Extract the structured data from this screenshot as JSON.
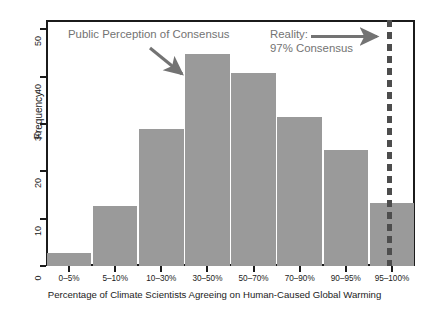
{
  "chart_data": {
    "type": "bar",
    "title": "",
    "subtitle": "",
    "xlabel": "Percentage of Climate Scientists Agreeing on Human-Caused Global Warming",
    "ylabel": "Frequency",
    "categories": [
      "0–5%",
      "5–10%",
      "10–30%",
      "30–50%",
      "50–70%",
      "70–90%",
      "90–95%",
      "95–100%"
    ],
    "values": [
      2.8,
      12.7,
      28.9,
      44.8,
      40.8,
      31.6,
      24.5,
      13.3
    ],
    "ylim": [
      0,
      52
    ],
    "yticks": [
      0,
      10,
      20,
      30,
      40,
      50
    ],
    "ytick_labels": [
      "0",
      "10",
      "20",
      "30",
      "40",
      "50"
    ],
    "grid": false,
    "legend": "none",
    "bar_color": "#9a9a9a",
    "axis_color": "#1b1b1b",
    "annotation_color": "#737373",
    "reference_line": {
      "label": "97% Consensus",
      "value": 97,
      "color": "#4d4d4d",
      "style": "dashed"
    },
    "annotations": [
      {
        "name": "public-perception",
        "text": "Public Perception of Consensus",
        "points_to": "30–50%"
      },
      {
        "name": "reality",
        "line1": "Reality:",
        "line2": "97% Consensus",
        "points_to": "97% reference line"
      }
    ]
  },
  "annotations": {
    "left": "Public Perception of Consensus",
    "right_line1": "Reality:",
    "right_line2": "97% Consensus"
  },
  "axes": {
    "ylabel": "Frequency",
    "xlabel": "Percentage of Climate Scientists Agreeing on Human-Caused Global Warming"
  }
}
